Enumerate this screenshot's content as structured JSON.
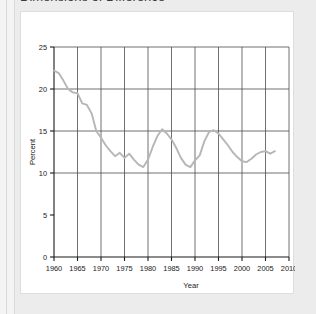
{
  "page": {
    "title": "Dimensions of Difference"
  },
  "chart_data": {
    "type": "line",
    "title": "",
    "xlabel": "Year",
    "ylabel": "Percent",
    "xlim": [
      1960,
      2010
    ],
    "ylim": [
      0,
      25
    ],
    "xticks": [
      1960,
      1965,
      1970,
      1975,
      1980,
      1985,
      1990,
      1995,
      2000,
      2005,
      2010
    ],
    "yticks": [
      0,
      5,
      10,
      15,
      20,
      25
    ],
    "xtick_labels": [
      "1960",
      "1965",
      "1970",
      "1975",
      "1980",
      "1985",
      "1990",
      "1995",
      "2000",
      "2005",
      "2010"
    ],
    "ytick_labels": [
      "0",
      "5",
      "10",
      "15",
      "20",
      "25"
    ],
    "grid": "vertical-and-horizontal",
    "legend": "none",
    "line_color": "#b6b6b6",
    "grid_color": "#4d4d4d",
    "axis_color": "#1a1a1a",
    "background": "#ffffff",
    "series": [
      {
        "name": "Percent",
        "x": [
          1960,
          1961,
          1962,
          1963,
          1964,
          1965,
          1966,
          1967,
          1968,
          1969,
          1970,
          1971,
          1972,
          1973,
          1974,
          1975,
          1976,
          1977,
          1978,
          1979,
          1980,
          1981,
          1982,
          1983,
          1984,
          1985,
          1986,
          1987,
          1988,
          1989,
          1990,
          1991,
          1992,
          1993,
          1994,
          1995,
          1996,
          1997,
          1998,
          1999,
          2000,
          2001,
          2002,
          2003,
          2004,
          2005,
          2006,
          2007
        ],
        "y": [
          22.2,
          21.9,
          21.0,
          20.0,
          19.6,
          19.5,
          18.3,
          18.1,
          17.1,
          15.0,
          14.2,
          13.3,
          12.6,
          12.0,
          12.4,
          11.8,
          12.3,
          11.6,
          11.0,
          10.7,
          11.6,
          13.1,
          14.4,
          15.2,
          14.7,
          14.0,
          13.0,
          11.8,
          11.0,
          10.7,
          11.5,
          12.1,
          13.8,
          14.9,
          15.1,
          14.7,
          14.0,
          13.3,
          12.5,
          11.9,
          11.4,
          11.3,
          11.7,
          12.2,
          12.5,
          12.6,
          12.3,
          12.6
        ]
      }
    ],
    "notes": {
      "start_value": 22.2,
      "end_value": 12.6,
      "max_value": 22.2,
      "min_value": 10.7
    }
  }
}
